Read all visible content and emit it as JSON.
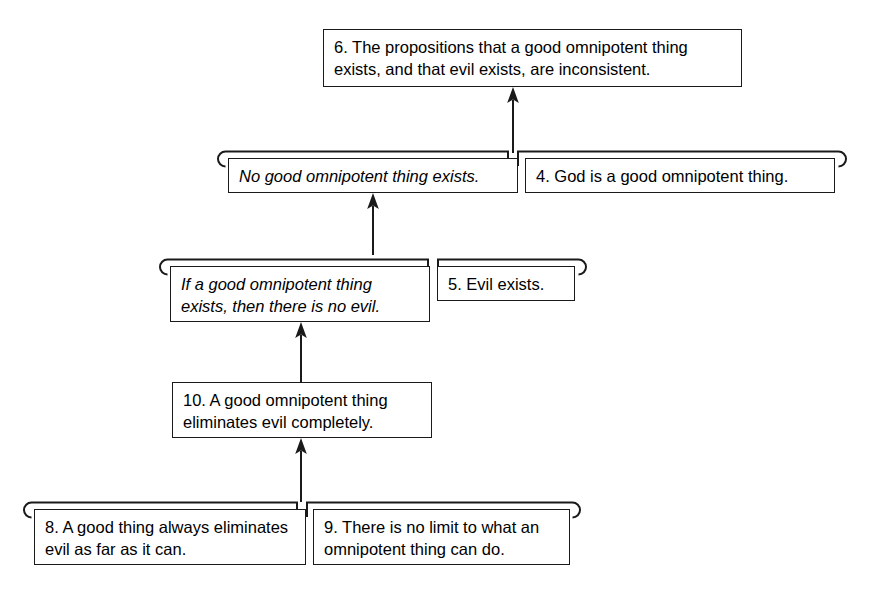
{
  "diagram": {
    "kind": "argument-map",
    "title_fragment": "",
    "colors": {
      "stroke": "#1a1a1a",
      "background": "#ffffff",
      "text": "#000000"
    },
    "nodes": [
      {
        "id": "n6",
        "label": "6. The propositions that a good omnipotent thing exists, and that evil exists, are inconsistent.",
        "number": "6",
        "role": "final-conclusion",
        "style": "roman"
      },
      {
        "id": "nC1",
        "label": "No good omnipotent thing exists.",
        "number": "",
        "role": "intermediate-conclusion",
        "style": "italic"
      },
      {
        "id": "n4",
        "label": "4. God is a good omnipotent thing.",
        "number": "4",
        "role": "premise",
        "style": "roman"
      },
      {
        "id": "nC2",
        "label": "If a good omnipotent thing exists, then there is no evil.",
        "number": "",
        "role": "intermediate-conclusion",
        "style": "italic"
      },
      {
        "id": "n5",
        "label": "5. Evil exists.",
        "number": "5",
        "role": "premise",
        "style": "roman"
      },
      {
        "id": "n10",
        "label": "10. A good omnipotent thing eliminates evil completely.",
        "number": "10",
        "role": "intermediate-conclusion",
        "style": "roman"
      },
      {
        "id": "n8",
        "label": "8. A good thing always eliminates evil as far as it can.",
        "number": "8",
        "role": "premise",
        "style": "roman"
      },
      {
        "id": "n9",
        "label": "9. There is no limit to what an omnipotent thing can do.",
        "number": "9",
        "role": "premise",
        "style": "roman"
      }
    ],
    "links": [
      {
        "id": "l1",
        "from": [
          "nC1",
          "n4"
        ],
        "to": "n6",
        "type": "linked"
      },
      {
        "id": "l2",
        "from": [
          "nC2",
          "n5"
        ],
        "to": "nC1",
        "type": "linked"
      },
      {
        "id": "l3",
        "from": [
          "n10"
        ],
        "to": "nC2",
        "type": "single"
      },
      {
        "id": "l4",
        "from": [
          "n8",
          "n9"
        ],
        "to": "n10",
        "type": "linked"
      }
    ]
  }
}
